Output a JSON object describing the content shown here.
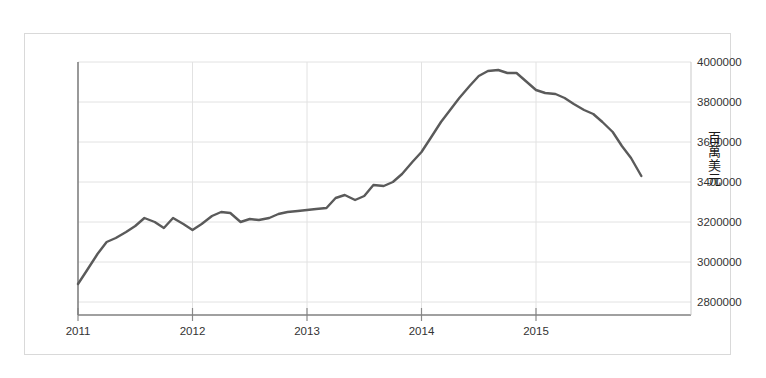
{
  "chart_data": {
    "type": "line",
    "title": "",
    "subtitle": "",
    "xlabel": "",
    "ylabel": "百萬美元",
    "ylabel_text": "百萬美元",
    "xlim": [
      2011.0,
      2015.92
    ],
    "ylim": [
      2800000,
      4000000
    ],
    "grid": true,
    "legend": false,
    "legend_position": "none",
    "line_color": "#5a5a5a",
    "x_tick_labels": [
      "2011",
      "2012",
      "2013",
      "2014",
      "2015"
    ],
    "x_tick_values": [
      2011,
      2012,
      2013,
      2014,
      2015
    ],
    "y_tick_labels": [
      "2800000",
      "3000000",
      "3200000",
      "3400000",
      "3600000",
      "3800000",
      "4000000"
    ],
    "y_tick_values": [
      2800000,
      3000000,
      3200000,
      3400000,
      3600000,
      3800000,
      4000000
    ],
    "y_axis_side": "right",
    "series": [
      {
        "name": "外匯存底",
        "x": [
          2011.0,
          2011.08,
          2011.17,
          2011.25,
          2011.33,
          2011.42,
          2011.5,
          2011.58,
          2011.67,
          2011.75,
          2011.83,
          2011.92,
          2012.0,
          2012.08,
          2012.17,
          2012.25,
          2012.33,
          2012.42,
          2012.5,
          2012.58,
          2012.67,
          2012.75,
          2012.83,
          2012.92,
          2013.0,
          2013.08,
          2013.17,
          2013.25,
          2013.33,
          2013.42,
          2013.5,
          2013.58,
          2013.67,
          2013.75,
          2013.83,
          2013.92,
          2014.0,
          2014.08,
          2014.17,
          2014.25,
          2014.33,
          2014.42,
          2014.5,
          2014.58,
          2014.67,
          2014.75,
          2014.83,
          2014.92,
          2015.0,
          2015.08,
          2015.17,
          2015.25,
          2015.33,
          2015.42,
          2015.5,
          2015.58,
          2015.67,
          2015.75,
          2015.83,
          2015.92
        ],
        "values": [
          2890000,
          2960000,
          3040000,
          3100000,
          3120000,
          3150000,
          3180000,
          3220000,
          3200000,
          3170000,
          3220000,
          3190000,
          3160000,
          3190000,
          3230000,
          3250000,
          3245000,
          3200000,
          3215000,
          3210000,
          3220000,
          3240000,
          3250000,
          3255000,
          3260000,
          3265000,
          3270000,
          3320000,
          3335000,
          3310000,
          3330000,
          3385000,
          3380000,
          3400000,
          3440000,
          3500000,
          3550000,
          3620000,
          3700000,
          3760000,
          3820000,
          3880000,
          3930000,
          3955000,
          3960000,
          3945000,
          3945000,
          3900000,
          3860000,
          3845000,
          3840000,
          3820000,
          3790000,
          3760000,
          3740000,
          3700000,
          3650000,
          3580000,
          3520000,
          3430000
        ]
      }
    ]
  },
  "axis": {
    "y_unit_label": "百萬美元"
  }
}
